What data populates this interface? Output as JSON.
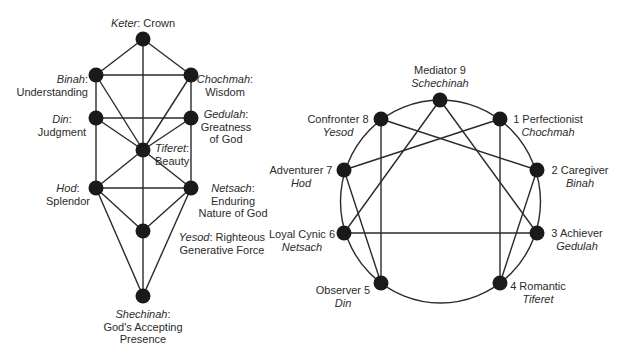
{
  "tree_of_life": {
    "nodes": {
      "keter": {
        "name": "Keter",
        "meaning": "Crown"
      },
      "binah": {
        "name": "Binah",
        "meaning": "Understanding"
      },
      "chochmah": {
        "name": "Chochmah",
        "meaning": "Wisdom"
      },
      "din": {
        "name": "Din",
        "meaning": "Judgment"
      },
      "gedulah": {
        "name": "Gedulah",
        "meaning_line1": "Greatness",
        "meaning_line2": "of God"
      },
      "tiferet": {
        "name": "Tiferet",
        "meaning": "Beauty"
      },
      "hod": {
        "name": "Hod",
        "meaning": "Splendor"
      },
      "netsach": {
        "name": "Netsach",
        "meaning_line1": "Enduring",
        "meaning_line2": "Nature of God"
      },
      "yesod": {
        "name": "Yesod",
        "meaning_line1": "Righteous",
        "meaning_line2": "Generative Force"
      },
      "shechinah": {
        "name": "Shechinah",
        "meaning_line1": "God's Accepting",
        "meaning_line2": "Presence"
      }
    },
    "colon": ":"
  },
  "enneagram": {
    "points": {
      "p9": {
        "type": "Mediator 9",
        "sefira": "Schechinah"
      },
      "p1": {
        "type": "1 Perfectionist",
        "sefira": "Chochmah"
      },
      "p2": {
        "type": "2 Caregiver",
        "sefira": "Binah"
      },
      "p3": {
        "type": "3 Achiever",
        "sefira": "Gedulah"
      },
      "p4": {
        "type": "4 Romantic",
        "sefira": "Tiferet"
      },
      "p5": {
        "type": "Observer 5",
        "sefira": "Din"
      },
      "p6": {
        "type": "Loyal Cynic 6",
        "sefira": "Netsach"
      },
      "p7": {
        "type": "Adventurer 7",
        "sefira": "Hod"
      },
      "p8": {
        "type": "Confronter 8",
        "sefira": "Yesod"
      }
    }
  },
  "colors": {
    "line": "#2a2a2a",
    "node": "#1a1a1a",
    "text": "#2b2b2b",
    "background": "#ffffff"
  }
}
